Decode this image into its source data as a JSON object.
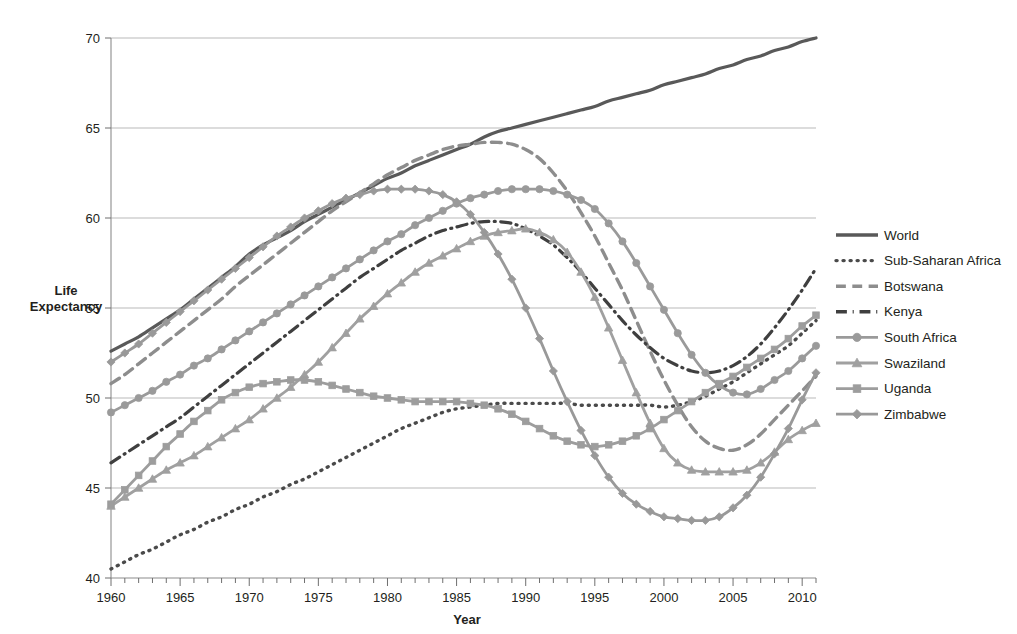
{
  "chart_data": {
    "type": "line",
    "title": "",
    "xlabel": "Year",
    "ylabel": "Life Expectancy",
    "ylabel_line1": "Life",
    "ylabel_line2": "Expectancy",
    "xlim": [
      1960,
      2011
    ],
    "ylim": [
      40,
      70
    ],
    "y_ticks": [
      40,
      45,
      50,
      55,
      60,
      65,
      70
    ],
    "x_ticks": [
      1960,
      1965,
      1970,
      1975,
      1980,
      1985,
      1990,
      1995,
      2000,
      2005,
      2010
    ],
    "x_minor_tick_step": 1,
    "grid": "horizontal",
    "legend_position": "right",
    "x": [
      1960,
      1961,
      1962,
      1963,
      1964,
      1965,
      1966,
      1967,
      1968,
      1969,
      1970,
      1971,
      1972,
      1973,
      1974,
      1975,
      1976,
      1977,
      1978,
      1979,
      1980,
      1981,
      1982,
      1983,
      1984,
      1985,
      1986,
      1987,
      1988,
      1989,
      1990,
      1991,
      1992,
      1993,
      1994,
      1995,
      1996,
      1997,
      1998,
      1999,
      2000,
      2001,
      2002,
      2003,
      2004,
      2005,
      2006,
      2007,
      2008,
      2009,
      2010,
      2011
    ],
    "series": [
      {
        "name": "World",
        "style": "solid",
        "marker": "none",
        "color": "#595959",
        "width": 3.2,
        "values": [
          52.6,
          53.0,
          53.4,
          53.9,
          54.4,
          54.9,
          55.5,
          56.1,
          56.7,
          57.3,
          58.0,
          58.5,
          58.9,
          59.3,
          59.8,
          60.2,
          60.6,
          61.0,
          61.4,
          61.8,
          62.2,
          62.5,
          62.9,
          63.2,
          63.5,
          63.8,
          64.1,
          64.5,
          64.8,
          65.0,
          65.2,
          65.4,
          65.6,
          65.8,
          66.0,
          66.2,
          66.5,
          66.7,
          66.9,
          67.1,
          67.4,
          67.6,
          67.8,
          68.0,
          68.3,
          68.5,
          68.8,
          69.0,
          69.3,
          69.5,
          69.8,
          70.0
        ]
      },
      {
        "name": "Sub-Saharan Africa",
        "style": "dotted",
        "marker": "none",
        "color": "#4a4a4a",
        "width": 3.4,
        "values": [
          40.5,
          40.9,
          41.3,
          41.6,
          42.0,
          42.4,
          42.7,
          43.1,
          43.4,
          43.8,
          44.1,
          44.5,
          44.8,
          45.2,
          45.5,
          45.9,
          46.3,
          46.7,
          47.1,
          47.5,
          47.9,
          48.3,
          48.6,
          48.9,
          49.2,
          49.4,
          49.5,
          49.6,
          49.7,
          49.7,
          49.7,
          49.7,
          49.7,
          49.7,
          49.6,
          49.6,
          49.6,
          49.6,
          49.6,
          49.6,
          49.5,
          49.6,
          49.8,
          50.1,
          50.5,
          50.9,
          51.4,
          51.9,
          52.4,
          52.9,
          53.6,
          54.3
        ]
      },
      {
        "name": "Botswana",
        "style": "dashed",
        "marker": "none",
        "color": "#8d8d8d",
        "width": 3.4,
        "values": [
          50.8,
          51.3,
          51.9,
          52.5,
          53.1,
          53.7,
          54.3,
          54.9,
          55.5,
          56.2,
          56.8,
          57.4,
          58.0,
          58.6,
          59.2,
          59.8,
          60.4,
          60.9,
          61.4,
          61.9,
          62.4,
          62.8,
          63.2,
          63.5,
          63.8,
          64.0,
          64.1,
          64.2,
          64.2,
          64.1,
          63.8,
          63.3,
          62.5,
          61.5,
          60.3,
          59.0,
          57.5,
          56.0,
          54.3,
          52.6,
          51.0,
          49.6,
          48.4,
          47.6,
          47.2,
          47.1,
          47.4,
          48.0,
          48.8,
          49.6,
          50.4,
          51.2
        ]
      },
      {
        "name": "Kenya",
        "style": "dashdot",
        "marker": "none",
        "color": "#3f3f3f",
        "width": 3.2,
        "values": [
          46.4,
          46.9,
          47.4,
          47.9,
          48.4,
          48.9,
          49.5,
          50.1,
          50.7,
          51.3,
          51.9,
          52.5,
          53.1,
          53.7,
          54.3,
          54.9,
          55.5,
          56.1,
          56.7,
          57.2,
          57.7,
          58.2,
          58.6,
          59.0,
          59.3,
          59.5,
          59.7,
          59.8,
          59.8,
          59.7,
          59.4,
          59.0,
          58.5,
          57.8,
          57.0,
          56.1,
          55.2,
          54.3,
          53.5,
          52.8,
          52.2,
          51.8,
          51.5,
          51.4,
          51.5,
          51.8,
          52.3,
          53.0,
          53.9,
          54.9,
          56.0,
          57.2
        ]
      },
      {
        "name": "South Africa",
        "style": "solid",
        "marker": "circle",
        "color": "#9a9a9a",
        "width": 2.8,
        "values": [
          49.2,
          49.6,
          50.0,
          50.4,
          50.9,
          51.3,
          51.8,
          52.2,
          52.7,
          53.2,
          53.7,
          54.2,
          54.7,
          55.2,
          55.7,
          56.2,
          56.7,
          57.2,
          57.7,
          58.2,
          58.7,
          59.1,
          59.6,
          60.0,
          60.4,
          60.8,
          61.1,
          61.3,
          61.5,
          61.6,
          61.6,
          61.6,
          61.5,
          61.3,
          61.0,
          60.5,
          59.7,
          58.7,
          57.5,
          56.2,
          54.9,
          53.6,
          52.4,
          51.4,
          50.7,
          50.3,
          50.2,
          50.5,
          51.0,
          51.5,
          52.2,
          52.9
        ]
      },
      {
        "name": "Swaziland",
        "style": "solid",
        "marker": "triangle",
        "color": "#a0a0a0",
        "width": 2.8,
        "values": [
          44.0,
          44.5,
          45.0,
          45.5,
          46.0,
          46.4,
          46.8,
          47.3,
          47.8,
          48.3,
          48.8,
          49.4,
          50.0,
          50.6,
          51.3,
          52.0,
          52.8,
          53.6,
          54.4,
          55.1,
          55.8,
          56.4,
          57.0,
          57.5,
          57.9,
          58.3,
          58.7,
          59.0,
          59.2,
          59.3,
          59.4,
          59.2,
          58.8,
          58.1,
          57.0,
          55.6,
          53.9,
          52.1,
          50.3,
          48.6,
          47.2,
          46.4,
          46.0,
          45.9,
          45.9,
          45.9,
          46.0,
          46.4,
          47.0,
          47.7,
          48.2,
          48.6
        ]
      },
      {
        "name": "Uganda",
        "style": "solid",
        "marker": "square",
        "color": "#9d9d9d",
        "width": 2.8,
        "values": [
          44.1,
          44.9,
          45.7,
          46.5,
          47.3,
          48.0,
          48.7,
          49.3,
          49.9,
          50.3,
          50.6,
          50.8,
          50.9,
          51.0,
          51.0,
          50.9,
          50.7,
          50.5,
          50.3,
          50.1,
          50.0,
          49.9,
          49.8,
          49.8,
          49.8,
          49.8,
          49.7,
          49.6,
          49.4,
          49.1,
          48.7,
          48.3,
          47.9,
          47.6,
          47.4,
          47.3,
          47.4,
          47.6,
          47.9,
          48.3,
          48.8,
          49.3,
          49.8,
          50.3,
          50.8,
          51.2,
          51.7,
          52.2,
          52.7,
          53.3,
          54.0,
          54.6
        ]
      },
      {
        "name": "Zimbabwe",
        "style": "solid",
        "marker": "diamond",
        "color": "#999999",
        "width": 2.8,
        "values": [
          52.0,
          52.5,
          53.0,
          53.6,
          54.2,
          54.8,
          55.4,
          56.0,
          56.6,
          57.2,
          57.8,
          58.4,
          59.0,
          59.5,
          60.0,
          60.4,
          60.8,
          61.1,
          61.3,
          61.5,
          61.6,
          61.6,
          61.6,
          61.5,
          61.3,
          60.9,
          60.2,
          59.2,
          58.0,
          56.6,
          55.0,
          53.3,
          51.5,
          49.8,
          48.2,
          46.8,
          45.6,
          44.7,
          44.1,
          43.7,
          43.4,
          43.3,
          43.2,
          43.2,
          43.4,
          43.9,
          44.6,
          45.6,
          46.9,
          48.3,
          49.9,
          51.4
        ]
      }
    ],
    "legend": [
      {
        "label": "World",
        "style": "solid",
        "marker": "none",
        "color": "#595959"
      },
      {
        "label": "Sub-Saharan Africa",
        "style": "dotted",
        "marker": "none",
        "color": "#4a4a4a"
      },
      {
        "label": "Botswana",
        "style": "dashed",
        "marker": "none",
        "color": "#8d8d8d"
      },
      {
        "label": "Kenya",
        "style": "dashdot",
        "marker": "none",
        "color": "#3f3f3f"
      },
      {
        "label": "South Africa",
        "style": "solid",
        "marker": "circle",
        "color": "#9a9a9a"
      },
      {
        "label": "Swaziland",
        "style": "solid",
        "marker": "triangle",
        "color": "#a0a0a0"
      },
      {
        "label": "Uganda",
        "style": "solid",
        "marker": "square",
        "color": "#9d9d9d"
      },
      {
        "label": "Zimbabwe",
        "style": "solid",
        "marker": "diamond",
        "color": "#999999"
      }
    ]
  }
}
